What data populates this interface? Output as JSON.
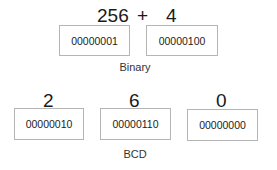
{
  "binary": {
    "header": {
      "a": "256",
      "op": "+",
      "b": "4"
    },
    "boxes": [
      "00000001",
      "00000100"
    ],
    "caption": "Binary"
  },
  "bcd": {
    "digits": [
      "2",
      "6",
      "0"
    ],
    "boxes": [
      "00000010",
      "00000110",
      "00000000"
    ],
    "caption": "BCD"
  }
}
